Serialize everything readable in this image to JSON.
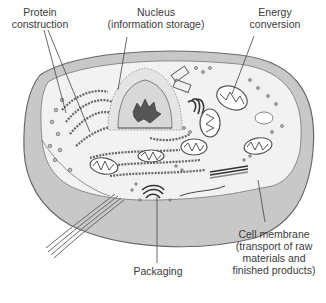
{
  "diagram": {
    "colors": {
      "background": "#ffffff",
      "cytoplasm": "#f2f2f2",
      "membrane": "#c8c8c8",
      "membrane_edge": "#6a6a6a",
      "organelle_line": "#555555",
      "organelle_fill": "#d0d0d0",
      "label_text": "#3a3a3a",
      "leader_line": "#444444"
    },
    "labels": {
      "protein": {
        "line1": "Protein",
        "line2": "construction"
      },
      "nucleus": {
        "line1": "Nucleus",
        "line2": "(information storage)"
      },
      "energy": {
        "line1": "Energy",
        "line2": "conversion"
      },
      "membrane": {
        "line1": "Cell membrane",
        "line2": "(transport of raw",
        "line3": "materials and",
        "line4": "finished products)"
      },
      "packaging": {
        "line1": "Packaging"
      }
    }
  }
}
